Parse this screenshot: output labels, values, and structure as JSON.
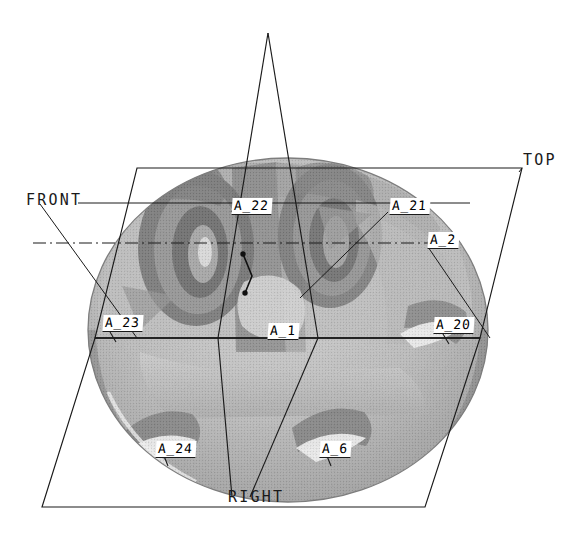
{
  "view": {
    "title": "Orthographic projection planes with datum feature callouts",
    "width": 585,
    "height": 535,
    "background_color": "#ffffff",
    "line_color": "#1a1a1a",
    "render_style": "halftone-shaded 3D solid on white drawing sheet"
  },
  "plane_labels": [
    {
      "id": "top",
      "text": "TOP",
      "x": 523,
      "y": 152
    },
    {
      "id": "front",
      "text": "FRONT",
      "x": 26,
      "y": 192
    },
    {
      "id": "right",
      "text": "RIGHT",
      "x": 228,
      "y": 496
    }
  ],
  "callouts": [
    {
      "id": "a22",
      "text": "A_22",
      "x": 232,
      "y": 198
    },
    {
      "id": "a21",
      "text": "A_21",
      "x": 390,
      "y": 198
    },
    {
      "id": "a2",
      "text": "A_2",
      "x": 428,
      "y": 232
    },
    {
      "id": "a23",
      "text": "A_23",
      "x": 103,
      "y": 318
    },
    {
      "id": "a1",
      "text": "A_1",
      "x": 268,
      "y": 325
    },
    {
      "id": "a20",
      "text": "A_20",
      "x": 434,
      "y": 320
    },
    {
      "id": "a24",
      "text": "A_24",
      "x": 156,
      "y": 444
    },
    {
      "id": "a6",
      "text": "A_6",
      "x": 320,
      "y": 444
    }
  ],
  "colors": {
    "sheet": "#ffffff",
    "line": "#1a1a1a",
    "shade_light": "#d8d8d8",
    "shade_mid": "#b4b4b4",
    "shade_dark": "#8a8a8a",
    "shade_darker": "#6e6e6e",
    "shade_deep": "#4a4a4a",
    "highlight": "#f2f2f2"
  },
  "geometry": {
    "top_plane": "parallelogram 137,168 522,168 480,338 95,338",
    "right_plane": "parallelogram 95,338 480,338 425,507 42,507",
    "front_plane": "triangle apex 268,33 down to 218,338 and 318,338",
    "centerline_y": 243,
    "centerline_x_from": 33,
    "centerline_x_to": 458,
    "part_ellipse": {
      "cx": 288,
      "cy": 330,
      "rx": 200,
      "ry": 172
    }
  }
}
